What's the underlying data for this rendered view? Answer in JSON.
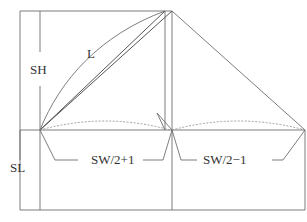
{
  "diagram": {
    "type": "sleeve pattern drafting diagram",
    "labels": {
      "sleeve_height": "SH",
      "bias_length": "L",
      "sleeve_length": "SL",
      "front_width": "SW/2+1",
      "back_width": "SW/2−1"
    }
  }
}
